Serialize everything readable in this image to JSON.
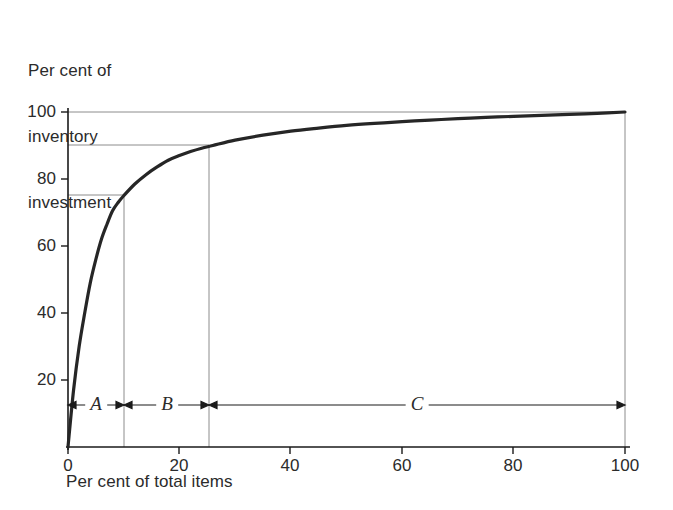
{
  "chart_data": {
    "type": "line",
    "title": "",
    "ylabel": "Per cent of\ninventory\ninvestment",
    "ylabel_lines": [
      "Per cent of",
      "inventory",
      "investment"
    ],
    "xlabel": "Per cent of total items",
    "xlim": [
      0,
      100
    ],
    "ylim": [
      0,
      100
    ],
    "xticks": [
      "0",
      "20",
      "40",
      "60",
      "80",
      "100"
    ],
    "xtick_values": [
      0,
      20,
      40,
      60,
      80,
      100
    ],
    "yticks": [
      "20",
      "40",
      "60",
      "80",
      "100"
    ],
    "ytick_values": [
      20,
      40,
      60,
      80,
      100
    ],
    "grid": "partial-reference-lines",
    "legend": "none",
    "series": [
      {
        "name": "Cumulative inventory investment",
        "x": [
          0,
          1,
          2,
          3,
          4,
          5,
          6,
          7,
          8,
          9,
          10,
          12,
          14,
          16,
          18,
          20,
          22,
          24,
          26,
          30,
          35,
          40,
          45,
          50,
          55,
          60,
          65,
          70,
          75,
          80,
          85,
          90,
          95,
          100
        ],
        "values": [
          0,
          17,
          30,
          40,
          49,
          56,
          62,
          66.5,
          70.5,
          73,
          75,
          78.5,
          81.3,
          83.6,
          85.6,
          87,
          88.2,
          89.2,
          90,
          91.6,
          93.1,
          94.3,
          95.2,
          96,
          96.6,
          97.1,
          97.6,
          98,
          98.4,
          98.7,
          99,
          99.3,
          99.6,
          100
        ]
      }
    ],
    "reference_lines": {
      "horizontal": [
        75,
        90,
        100
      ],
      "vertical": [
        10,
        26,
        100
      ]
    },
    "breakpoints": [
      {
        "label": "A",
        "x_start": 0,
        "x_end": 10,
        "y_at_end": 75
      },
      {
        "label": "B",
        "x_start": 10,
        "x_end": 26,
        "y_at_end": 90
      },
      {
        "label": "C",
        "x_start": 26,
        "x_end": 100,
        "y_at_end": 100
      }
    ],
    "segment_arrows_y": 18,
    "colors": {
      "curve": "#262626",
      "axis": "#1a1a1a",
      "gridline": "#8c8c8c",
      "text": "#2b2b2b",
      "background": "#ffffff"
    }
  }
}
